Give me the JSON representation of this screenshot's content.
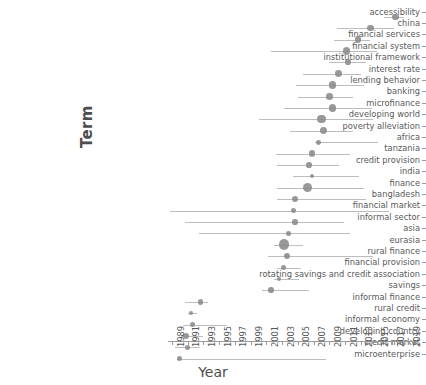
{
  "chart_data": {
    "type": "scatter",
    "title": "",
    "xlabel": "Year",
    "ylabel": "Term",
    "xlim": [
      1988.5,
      2019.8
    ],
    "grid": false,
    "legend": null,
    "xticks": [
      1989,
      1991,
      1993,
      1995,
      1997,
      1999,
      2001,
      2003,
      2005,
      2007,
      2009,
      2011,
      2013,
      2015,
      2017,
      2019
    ],
    "categories": [
      "accessibility",
      "china",
      "financial services",
      "financial system",
      "institutional framework",
      "interest rate",
      "lending behavior",
      "banking",
      "microfinance",
      "developing world",
      "poverty alleviation",
      "africa",
      "tanzania",
      "credit provision",
      "india",
      "finance",
      "bangladesh",
      "financial market",
      "informal sector",
      "asia",
      "eurasia",
      "rural finance",
      "financial provision",
      "rotating savings and credit association",
      "savings",
      "informal finance",
      "rural credit",
      "informal economy",
      "developing country",
      "credit market",
      "microenterprise"
    ],
    "points": [
      {
        "term": "accessibility",
        "year": 2017.4,
        "low": 2016.0,
        "high": 2018.5,
        "size": 5.0
      },
      {
        "term": "china",
        "year": 2014.2,
        "low": 2010.0,
        "high": 2017.2,
        "size": 5.4
      },
      {
        "term": "financial services",
        "year": 2012.6,
        "low": 2009.6,
        "high": 2014.2,
        "size": 5.0
      },
      {
        "term": "financial system",
        "year": 2011.2,
        "low": 2001.6,
        "high": 2015.0,
        "size": 6.2
      },
      {
        "term": "institutional framework",
        "year": 2011.4,
        "low": 2009.0,
        "high": 2013.6,
        "size": 4.6
      },
      {
        "term": "interest rate",
        "year": 2010.2,
        "low": 2005.6,
        "high": 2013.0,
        "size": 5.6
      },
      {
        "term": "lending behavior",
        "year": 2009.4,
        "low": 2004.8,
        "high": 2013.4,
        "size": 6.2
      },
      {
        "term": "banking",
        "year": 2009.0,
        "low": 2005.0,
        "high": 2012.0,
        "size": 5.4
      },
      {
        "term": "microfinance",
        "year": 2009.4,
        "low": 2003.2,
        "high": 2014.4,
        "size": 6.0
      },
      {
        "term": "developing world",
        "year": 2008.0,
        "low": 2000.0,
        "high": 2014.6,
        "size": 6.8
      },
      {
        "term": "poverty alleviation",
        "year": 2008.2,
        "low": 2004.0,
        "high": 2012.0,
        "size": 5.6
      },
      {
        "term": "africa",
        "year": 2007.6,
        "low": 2007.2,
        "high": 2015.2,
        "size": 4.0
      },
      {
        "term": "tanzania",
        "year": 2006.8,
        "low": 2002.2,
        "high": 2011.6,
        "size": 5.4
      },
      {
        "term": "credit provision",
        "year": 2006.4,
        "low": 2002.4,
        "high": 2010.2,
        "size": 4.6
      },
      {
        "term": "india",
        "year": 2006.8,
        "low": 2004.4,
        "high": 2012.8,
        "size": 3.4
      },
      {
        "term": "finance",
        "year": 2006.2,
        "low": 2002.4,
        "high": 2013.4,
        "size": 7.6
      },
      {
        "term": "bangladesh",
        "year": 2004.6,
        "low": 2002.4,
        "high": 2013.6,
        "size": 5.2
      },
      {
        "term": "financial market",
        "year": 2004.4,
        "low": 1988.8,
        "high": 2016.6,
        "size": 4.4
      },
      {
        "term": "informal sector",
        "year": 2004.6,
        "low": 1990.6,
        "high": 2010.8,
        "size": 4.6
      },
      {
        "term": "asia",
        "year": 2003.8,
        "low": 1992.4,
        "high": 2011.6,
        "size": 4.2
      },
      {
        "term": "eurasia",
        "year": 2003.2,
        "low": 2002.0,
        "high": 2005.6,
        "size": 8.6
      },
      {
        "term": "rural finance",
        "year": 2003.6,
        "low": 2001.2,
        "high": 2014.6,
        "size": 5.0
      },
      {
        "term": "financial provision",
        "year": 2003.2,
        "low": 2002.4,
        "high": 2005.4,
        "size": 4.2
      },
      {
        "term": "rotating savings and credit association",
        "year": 2002.6,
        "low": 2002.0,
        "high": 2005.2,
        "size": 3.8
      },
      {
        "term": "savings",
        "year": 2001.6,
        "low": 2000.4,
        "high": 2006.4,
        "size": 4.6
      },
      {
        "term": "informal finance",
        "year": 2000.6,
        "low": 1999.6,
        "high": 2001.4,
        "size": 4.0
      },
      {
        "term": "rural credit",
        "year": 1999.0,
        "low": 1998.2,
        "high": 2011.4,
        "size": 3.4
      },
      {
        "term": "informal finance ",
        "year": 1992.6,
        "low": 1990.6,
        "high": 1993.6,
        "size": 4.6
      },
      {
        "term": "rural credit ",
        "year": 1991.4,
        "low": 1991.0,
        "high": 1992.2,
        "size": 3.6
      },
      {
        "term": "informal economy",
        "year": 1991.6,
        "low": 1990.4,
        "high": 1996.0,
        "size": 4.2
      },
      {
        "term": "developing country",
        "year": 1990.8,
        "low": 1990.2,
        "high": 1993.0,
        "size": 5.4
      },
      {
        "term": "credit market",
        "year": 1991.0,
        "low": 1989.4,
        "high": 1992.6,
        "size": 4.2
      },
      {
        "term": "microenterprise",
        "year": 1990.0,
        "low": 1989.6,
        "high": 2008.6,
        "size": 4.2
      }
    ]
  },
  "axis": {
    "y_title": "Term",
    "x_title": "Year"
  },
  "terms": [
    "accessibility",
    "china",
    "financial services",
    "financial system",
    "institutional framework",
    "interest rate",
    "lending behavior",
    "banking",
    "microfinance",
    "developing world",
    "poverty alleviation",
    "africa",
    "tanzania",
    "credit provision",
    "india",
    "finance",
    "bangladesh",
    "financial market",
    "informal sector",
    "asia",
    "eurasia",
    "rural finance",
    "financial provision",
    "rotating savings and credit association",
    "savings",
    "informal finance",
    "rural credit",
    "informal economy",
    "developing country",
    "credit market",
    "microenterprise"
  ],
  "rows": [
    {
      "term": "accessibility",
      "year": 2017.4,
      "low": 2016.0,
      "high": 2018.5,
      "size": 5.0
    },
    {
      "term": "china",
      "year": 2014.2,
      "low": 2010.0,
      "high": 2017.2,
      "size": 5.4
    },
    {
      "term": "financial services",
      "year": 2012.6,
      "low": 2009.6,
      "high": 2014.2,
      "size": 5.0
    },
    {
      "term": "financial system",
      "year": 2011.2,
      "low": 2001.6,
      "high": 2015.0,
      "size": 6.2
    },
    {
      "term": "institutional framework",
      "year": 2011.4,
      "low": 2009.0,
      "high": 2013.6,
      "size": 4.6
    },
    {
      "term": "interest rate",
      "year": 2010.2,
      "low": 2005.6,
      "high": 2013.0,
      "size": 5.6
    },
    {
      "term": "lending behavior",
      "year": 2009.4,
      "low": 2004.8,
      "high": 2013.4,
      "size": 6.2
    },
    {
      "term": "banking",
      "year": 2009.0,
      "low": 2005.0,
      "high": 2012.0,
      "size": 5.4
    },
    {
      "term": "microfinance",
      "year": 2009.4,
      "low": 2003.2,
      "high": 2014.4,
      "size": 6.0
    },
    {
      "term": "developing world",
      "year": 2008.0,
      "low": 2000.0,
      "high": 2014.6,
      "size": 6.8
    },
    {
      "term": "poverty alleviation",
      "year": 2008.2,
      "low": 2004.0,
      "high": 2012.0,
      "size": 5.6
    },
    {
      "term": "africa",
      "year": 2007.6,
      "low": 2007.2,
      "high": 2015.2,
      "size": 4.0
    },
    {
      "term": "tanzania",
      "year": 2006.8,
      "low": 2002.2,
      "high": 2011.6,
      "size": 5.4
    },
    {
      "term": "credit provision",
      "year": 2006.4,
      "low": 2002.4,
      "high": 2010.2,
      "size": 4.6
    },
    {
      "term": "india",
      "year": 2006.8,
      "low": 2004.4,
      "high": 2012.8,
      "size": 3.4
    },
    {
      "term": "finance",
      "year": 2006.2,
      "low": 2002.4,
      "high": 2013.4,
      "size": 7.6
    },
    {
      "term": "bangladesh",
      "year": 2004.6,
      "low": 2002.4,
      "high": 2013.6,
      "size": 5.2
    },
    {
      "term": "financial market",
      "year": 2004.4,
      "low": 1988.8,
      "high": 2016.6,
      "size": 4.4
    },
    {
      "term": "informal sector",
      "year": 2004.6,
      "low": 1990.6,
      "high": 2010.8,
      "size": 4.6
    },
    {
      "term": "asia",
      "year": 2003.8,
      "low": 1992.4,
      "high": 2011.6,
      "size": 4.2
    },
    {
      "term": "eurasia",
      "year": 2003.2,
      "low": 2002.0,
      "high": 2005.6,
      "size": 8.6
    },
    {
      "term": "rural finance",
      "year": 2003.6,
      "low": 2001.2,
      "high": 2014.6,
      "size": 5.0
    },
    {
      "term": "financial provision",
      "year": 2003.2,
      "low": 2002.4,
      "high": 2005.4,
      "size": 4.2
    },
    {
      "term": "rotating savings and credit association",
      "year": 2002.6,
      "low": 2002.0,
      "high": 2005.2,
      "size": 3.8
    },
    {
      "term": "savings",
      "year": 2001.6,
      "low": 2000.4,
      "high": 2006.4,
      "size": 4.6
    },
    {
      "term": "informal finance",
      "year": 1992.6,
      "low": 1990.6,
      "high": 1993.6,
      "size": 4.6
    },
    {
      "term": "rural credit",
      "year": 1991.4,
      "low": 1991.0,
      "high": 1992.2,
      "size": 3.6
    },
    {
      "term": "informal economy",
      "year": 1991.6,
      "low": 1990.4,
      "high": 1996.0,
      "size": 4.2
    },
    {
      "term": "developing country",
      "year": 1990.8,
      "low": 1990.2,
      "high": 1993.0,
      "size": 5.4
    },
    {
      "term": "credit market",
      "year": 1991.0,
      "low": 1989.4,
      "high": 1992.6,
      "size": 4.2
    },
    {
      "term": "microenterprise",
      "year": 1990.0,
      "low": 1989.6,
      "high": 2008.6,
      "size": 4.2
    }
  ],
  "xticks": [
    1989,
    1991,
    1993,
    1995,
    1997,
    1999,
    2001,
    2003,
    2005,
    2007,
    2009,
    2011,
    2013,
    2015,
    2017,
    2019
  ]
}
